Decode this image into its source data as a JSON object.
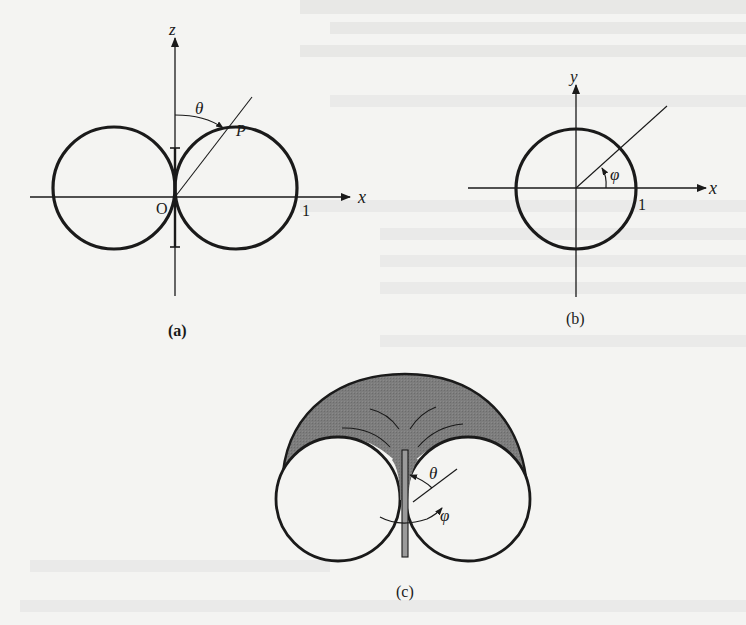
{
  "page": {
    "background": "#f4f4f2",
    "ink_color": "#1a1a1a",
    "shade_color": "#7d7d7d"
  },
  "bleed_through_lines": [
    "",
    "",
    "",
    "",
    "",
    ""
  ],
  "figures": {
    "a": {
      "caption": "(a)",
      "axis_vertical_label": "z",
      "axis_horizontal_label": "x",
      "origin_label": "O",
      "unit_label": "1",
      "angle_label": "θ",
      "point_label": "P",
      "description": "Two tangent circles (figure-eight dipole pattern) in the x–z plane with antenna along z; angle θ measured from z-axis to point P"
    },
    "b": {
      "caption": "(b)",
      "axis_vertical_label": "y",
      "axis_horizontal_label": "x",
      "unit_label": "1",
      "angle_label": "φ",
      "description": "Unit circle in the x–y plane; angle φ measured from x-axis"
    },
    "c": {
      "caption": "(c)",
      "angle_theta_label": "θ",
      "angle_phi_label": "φ",
      "description": "3D toroidal radiation pattern of a dipole antenna (vertical rod) with shaded upper half"
    }
  }
}
